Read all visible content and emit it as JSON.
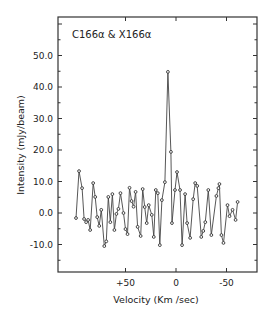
{
  "chart_data": {
    "type": "line",
    "title": "",
    "annotation": "C166α & X166α",
    "xlabel": "Velocity (Km /sec)",
    "ylabel": "Intensity (mJy/beam)",
    "xlim": [
      100,
      -80
    ],
    "ylim": [
      -17,
      61
    ],
    "x_ticks": [
      50,
      0,
      -50
    ],
    "x_tick_labels": [
      "+50",
      "0",
      "-50"
    ],
    "y_ticks": [
      -10,
      0,
      10,
      20,
      30,
      40,
      50
    ],
    "y_tick_labels": [
      "-10.0",
      "0.0",
      "10.0",
      "20.0",
      "30.0",
      "40.0",
      "50.0"
    ],
    "grid": false,
    "legend": null,
    "marker": "open-circle",
    "series": [
      {
        "name": "C166α & X166α",
        "x": [
          99,
          96,
          93,
          91,
          89,
          87,
          85,
          82,
          80,
          78,
          76,
          74,
          71,
          69,
          67,
          65,
          63,
          61,
          59,
          57,
          55,
          52,
          50,
          48,
          46,
          44,
          42,
          40,
          38,
          35,
          33,
          31,
          29,
          27,
          24,
          22,
          20,
          18,
          16,
          14,
          11,
          8,
          5,
          4,
          1,
          -1,
          -4,
          -6,
          -9,
          -11,
          -14,
          -17,
          -19,
          -21,
          -25,
          -27,
          -29,
          -32,
          -35,
          -40,
          -42,
          -43,
          -45,
          -47,
          -51,
          -53,
          -56,
          -59,
          -61
        ],
        "values": [
          -1.6,
          13.3,
          7.9,
          -1.9,
          -2.9,
          -2.2,
          -5.4,
          9.5,
          5.1,
          -1.3,
          -4.1,
          1.0,
          -10.5,
          -9.0,
          5.1,
          -2.9,
          6.0,
          -5.4,
          -0.3,
          1.3,
          6.3,
          0.0,
          -5.1,
          -6.7,
          8.0,
          3.8,
          2.0,
          6.7,
          -4.4,
          -7.3,
          7.6,
          1.9,
          -3.2,
          2.5,
          -0.6,
          -7.6,
          7.3,
          6.3,
          -10.2,
          4.1,
          9.8,
          44.8,
          19.4,
          -3.2,
          7.3,
          13.0,
          7.3,
          -10.2,
          6.0,
          -3.2,
          -7.9,
          4.4,
          9.5,
          8.6,
          -7.6,
          -5.7,
          -2.9,
          7.3,
          -7.0,
          5.4,
          7.9,
          9.2,
          -7.0,
          -9.5,
          2.5,
          -1.0,
          1.0,
          -2.2,
          3.5
        ]
      }
    ]
  }
}
